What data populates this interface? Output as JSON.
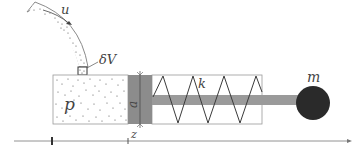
{
  "diagram": {
    "labels": {
      "velocity": "u",
      "volume_element": "δV",
      "pressure": "p",
      "piston_area": "a",
      "spring_constant": "k",
      "mass": "m",
      "position": "z"
    },
    "colors": {
      "stroke": "#6a6a6a",
      "piston": "#8c8c8c",
      "rod": "#9a9a9a",
      "mass": "#2a2a2a",
      "particles": "#555555",
      "spring": "#3a3a3a"
    }
  }
}
